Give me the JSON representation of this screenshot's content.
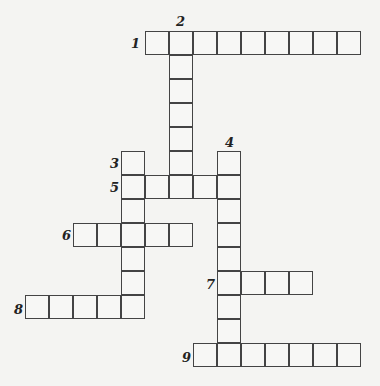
{
  "puzzle": {
    "cell_size": 24,
    "origin": {
      "x": 25,
      "y": 31
    },
    "clues": [
      {
        "number": "1",
        "direction": "across",
        "row": 0,
        "col": 5,
        "length": 9,
        "label_pos": {
          "x": 131,
          "y": 37
        }
      },
      {
        "number": "2",
        "direction": "down",
        "row": 0,
        "col": 6,
        "length": 7,
        "label_pos": {
          "x": 176,
          "y": 15
        }
      },
      {
        "number": "3",
        "direction": "down",
        "row": 5,
        "col": 4,
        "length": 7,
        "label_pos": {
          "x": 110,
          "y": 157
        }
      },
      {
        "number": "4",
        "direction": "down",
        "row": 5,
        "col": 8,
        "length": 9,
        "label_pos": {
          "x": 225,
          "y": 136
        }
      },
      {
        "number": "5",
        "direction": "across",
        "row": 6,
        "col": 4,
        "length": 5,
        "label_pos": {
          "x": 110,
          "y": 181
        }
      },
      {
        "number": "6",
        "direction": "across",
        "row": 8,
        "col": 2,
        "length": 5,
        "label_pos": {
          "x": 62,
          "y": 229
        }
      },
      {
        "number": "7",
        "direction": "across",
        "row": 10,
        "col": 8,
        "length": 4,
        "label_pos": {
          "x": 206,
          "y": 278
        }
      },
      {
        "number": "8",
        "direction": "across",
        "row": 11,
        "col": 0,
        "length": 5,
        "label_pos": {
          "x": 14,
          "y": 303
        }
      },
      {
        "number": "9",
        "direction": "across",
        "row": 13,
        "col": 7,
        "length": 7,
        "label_pos": {
          "x": 182,
          "y": 351
        }
      }
    ]
  }
}
